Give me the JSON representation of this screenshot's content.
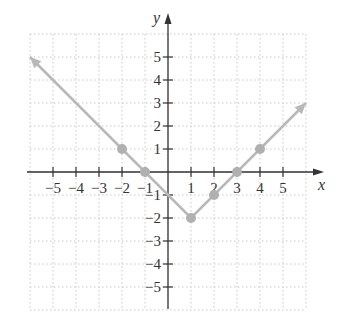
{
  "chart_data": {
    "type": "line",
    "title": "",
    "xlabel": "x",
    "ylabel": "y",
    "xlim": [
      -6,
      6
    ],
    "ylim": [
      -6,
      6
    ],
    "grid": true,
    "x_ticks": [
      -5,
      -4,
      -3,
      -2,
      -1,
      1,
      2,
      3,
      4,
      5
    ],
    "y_ticks": [
      -5,
      -4,
      -3,
      -2,
      -1,
      1,
      2,
      3,
      4,
      5
    ],
    "x_tick_labels": [
      "−5",
      "−4",
      "−3",
      "−2",
      "−1",
      "1",
      "2",
      "3",
      "4",
      "5"
    ],
    "y_tick_labels": [
      "−5",
      "−4",
      "−3",
      "−2",
      "−1",
      "1",
      "2",
      "3",
      "4",
      "5"
    ],
    "series": [
      {
        "name": "y = |x − 1| − 2",
        "color": "#b8b8b8",
        "x": [
          -6,
          1,
          6
        ],
        "y": [
          5,
          -2,
          3
        ],
        "arrows": "both"
      }
    ],
    "points": [
      {
        "x": -2,
        "y": 1
      },
      {
        "x": -1,
        "y": 0
      },
      {
        "x": 1,
        "y": -2
      },
      {
        "x": 2,
        "y": -1
      },
      {
        "x": 3,
        "y": 0
      },
      {
        "x": 4,
        "y": 1
      }
    ],
    "colors": {
      "axis": "#333333",
      "grid": "#c8c8c8",
      "line": "#b8b8b8",
      "point": "#b0b0b0"
    }
  }
}
